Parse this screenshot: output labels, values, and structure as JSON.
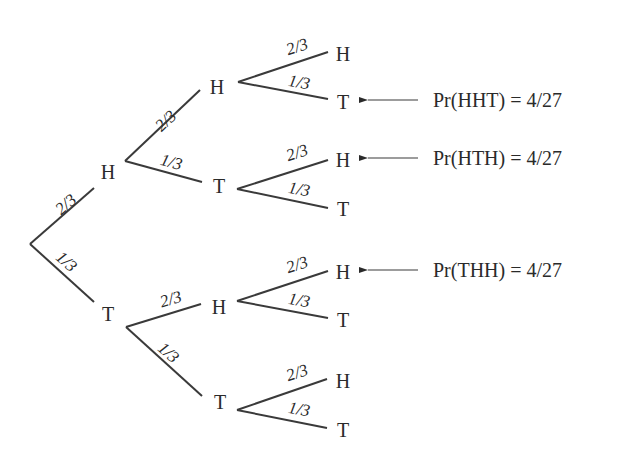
{
  "colors": {
    "line": "#3a3a3a",
    "text": "#2a2a2a",
    "background": "#ffffff"
  },
  "tree": {
    "root": {
      "x": 30,
      "y": 244
    },
    "nodes": [
      {
        "id": "H",
        "label": "H",
        "x": 108,
        "y": 172
      },
      {
        "id": "T",
        "label": "T",
        "x": 108,
        "y": 314
      },
      {
        "id": "HH",
        "label": "H",
        "x": 217,
        "y": 87
      },
      {
        "id": "HT",
        "label": "T",
        "x": 219,
        "y": 186
      },
      {
        "id": "TH",
        "label": "H",
        "x": 219,
        "y": 307
      },
      {
        "id": "TT",
        "label": "T",
        "x": 220,
        "y": 402
      },
      {
        "id": "HHH",
        "label": "H",
        "x": 343,
        "y": 54
      },
      {
        "id": "HHT",
        "label": "T",
        "x": 343,
        "y": 102
      },
      {
        "id": "HTH",
        "label": "H",
        "x": 343,
        "y": 160
      },
      {
        "id": "HTT",
        "label": "T",
        "x": 343,
        "y": 209
      },
      {
        "id": "THH",
        "label": "H",
        "x": 343,
        "y": 272
      },
      {
        "id": "THT",
        "label": "T",
        "x": 343,
        "y": 320
      },
      {
        "id": "TTH",
        "label": "H",
        "x": 343,
        "y": 381
      },
      {
        "id": "TTT",
        "label": "T",
        "x": 343,
        "y": 430
      }
    ],
    "edges": [
      {
        "x1": 30,
        "y1": 244,
        "x2": 94,
        "y2": 188,
        "label": "2/3",
        "lx": 52,
        "ly": 205,
        "rot": -41
      },
      {
        "x1": 30,
        "y1": 244,
        "x2": 94,
        "y2": 302,
        "label": "1/3",
        "lx": 64,
        "ly": 248,
        "rot": 42
      },
      {
        "x1": 125,
        "y1": 161,
        "x2": 200,
        "y2": 90,
        "label": "2/3",
        "lx": 152,
        "ly": 122,
        "rot": -43
      },
      {
        "x1": 125,
        "y1": 161,
        "x2": 202,
        "y2": 182,
        "label": "1/3",
        "lx": 163,
        "ly": 151,
        "rot": 15
      },
      {
        "x1": 126,
        "y1": 327,
        "x2": 201,
        "y2": 304,
        "label": "2/3",
        "lx": 158,
        "ly": 294,
        "rot": -16
      },
      {
        "x1": 126,
        "y1": 327,
        "x2": 202,
        "y2": 396,
        "label": "1/3",
        "lx": 166,
        "ly": 339,
        "rot": 42
      },
      {
        "x1": 238,
        "y1": 82,
        "x2": 328,
        "y2": 52,
        "label": "2/3",
        "lx": 284,
        "ly": 42,
        "rot": -18
      },
      {
        "x1": 238,
        "y1": 82,
        "x2": 328,
        "y2": 99,
        "label": "1/3",
        "lx": 290,
        "ly": 72,
        "rot": 10
      },
      {
        "x1": 237,
        "y1": 189,
        "x2": 328,
        "y2": 160,
        "label": "2/3",
        "lx": 284,
        "ly": 148,
        "rot": -18
      },
      {
        "x1": 237,
        "y1": 189,
        "x2": 328,
        "y2": 208,
        "label": "1/3",
        "lx": 290,
        "ly": 179,
        "rot": 10
      },
      {
        "x1": 237,
        "y1": 301,
        "x2": 328,
        "y2": 271,
        "label": "2/3",
        "lx": 284,
        "ly": 260,
        "rot": -18
      },
      {
        "x1": 237,
        "y1": 301,
        "x2": 328,
        "y2": 318,
        "label": "1/3",
        "lx": 290,
        "ly": 290,
        "rot": 10
      },
      {
        "x1": 237,
        "y1": 410,
        "x2": 327,
        "y2": 379,
        "label": "2/3",
        "lx": 284,
        "ly": 368,
        "rot": -18
      },
      {
        "x1": 237,
        "y1": 410,
        "x2": 327,
        "y2": 428,
        "label": "1/3",
        "lx": 290,
        "ly": 399,
        "rot": 10
      }
    ]
  },
  "annotations": [
    {
      "text": "Pr(HHT) = 4/27",
      "arrow_x1": 366,
      "arrow_x2": 418,
      "y": 100,
      "text_x": 433
    },
    {
      "text": "Pr(HTH) = 4/27",
      "arrow_x1": 366,
      "arrow_x2": 418,
      "y": 158,
      "text_x": 433
    },
    {
      "text": "Pr(THH) = 4/27",
      "arrow_x1": 366,
      "arrow_x2": 418,
      "y": 270,
      "text_x": 433
    }
  ]
}
